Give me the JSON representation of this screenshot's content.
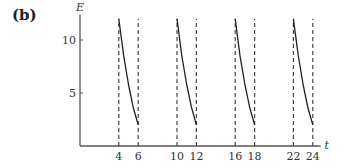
{
  "panel_label": "(b)",
  "chart_data": {
    "type": "line",
    "title": "",
    "xlabel": "t",
    "ylabel": "E",
    "xlim": [
      0,
      25
    ],
    "ylim": [
      0,
      13
    ],
    "x_ticks": [
      4,
      6,
      10,
      12,
      16,
      18,
      22,
      24
    ],
    "y_ticks": [
      5,
      10
    ],
    "grid": false,
    "legend": null,
    "series": [
      {
        "name": "segment 1",
        "x": [
          4,
          4.5,
          5,
          5.5,
          6
        ],
        "y": [
          12,
          8.5,
          5.8,
          3.6,
          2
        ]
      },
      {
        "name": "segment 2",
        "x": [
          10,
          10.5,
          11,
          11.5,
          12
        ],
        "y": [
          12,
          8.5,
          5.8,
          3.6,
          2
        ]
      },
      {
        "name": "segment 3",
        "x": [
          16,
          16.5,
          17,
          17.5,
          18
        ],
        "y": [
          12,
          8.5,
          5.8,
          3.6,
          2
        ]
      },
      {
        "name": "segment 4",
        "x": [
          22,
          22.5,
          23,
          23.5,
          24
        ],
        "y": [
          12,
          8.5,
          5.8,
          3.6,
          2
        ]
      }
    ],
    "annotations": [
      "dashed vertical lines at t = 4, 6, 10, 12, 16, 18, 22, 24"
    ]
  }
}
